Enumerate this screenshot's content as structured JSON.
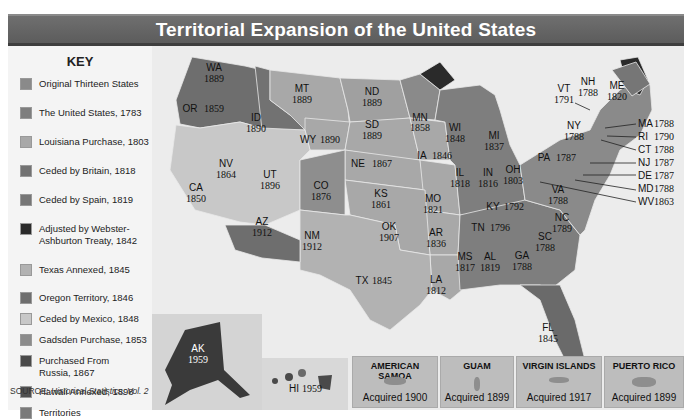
{
  "title": "Territorial Expansion of the United States",
  "key": {
    "heading": "KEY",
    "items": [
      {
        "label": "Original Thirteen States",
        "color": "#8a8a8a"
      },
      {
        "label": "The United States, 1783",
        "color": "#7e7e7e"
      },
      {
        "label": "Louisiana Purchase, 1803",
        "color": "#a8a8a8"
      },
      {
        "label": "Ceded by Britain, 1818",
        "color": "#727272"
      },
      {
        "label": "Ceded by Spain, 1819",
        "color": "#767676"
      },
      {
        "label": "Adjusted by Webster-Ashburton Treaty, 1842",
        "color": "#2a2a2a"
      },
      {
        "label": "Texas Annexed, 1845",
        "color": "#b2b2b2"
      },
      {
        "label": "Oregon Territory, 1846",
        "color": "#6e6e6e"
      },
      {
        "label": "Ceded by Mexico, 1848",
        "color": "#c8c8c8"
      },
      {
        "label": "Gadsden Purchase, 1853",
        "color": "#8c8c8c"
      },
      {
        "label": "Purchased From Russia, 1867",
        "color": "#4a4a4a"
      },
      {
        "label": "Hawaii Annexed, 1898",
        "color": "#505050"
      },
      {
        "label": "Territories",
        "color": "#7a7a7a"
      }
    ],
    "source_prefix": "SOURCE: ",
    "source_title": "Historical Statistics, Vol. 2"
  },
  "states": {
    "WA": {
      "abbr": "WA",
      "year": "1889"
    },
    "OR": {
      "abbr": "OR",
      "year": "1859"
    },
    "ID": {
      "abbr": "ID",
      "year": "1890"
    },
    "MT": {
      "abbr": "MT",
      "year": "1889"
    },
    "WY": {
      "abbr": "WY",
      "year": "1890"
    },
    "ND": {
      "abbr": "ND",
      "year": "1889"
    },
    "SD": {
      "abbr": "SD",
      "year": "1889"
    },
    "MN": {
      "abbr": "MN",
      "year": "1858"
    },
    "WI": {
      "abbr": "WI",
      "year": "1848"
    },
    "MI": {
      "abbr": "MI",
      "year": "1837"
    },
    "NV": {
      "abbr": "NV",
      "year": "1864"
    },
    "UT": {
      "abbr": "UT",
      "year": "1896"
    },
    "CA": {
      "abbr": "CA",
      "year": "1850"
    },
    "CO": {
      "abbr": "CO",
      "year": "1876"
    },
    "NE": {
      "abbr": "NE",
      "year": "1867"
    },
    "IA": {
      "abbr": "IA",
      "year": "1846"
    },
    "KS": {
      "abbr": "KS",
      "year": "1861"
    },
    "MO": {
      "abbr": "MO",
      "year": "1821"
    },
    "IL": {
      "abbr": "IL",
      "year": "1818"
    },
    "IN": {
      "abbr": "IN",
      "year": "1816"
    },
    "OH": {
      "abbr": "OH",
      "year": "1803"
    },
    "AZ": {
      "abbr": "AZ",
      "year": "1912"
    },
    "NM": {
      "abbr": "NM",
      "year": "1912"
    },
    "OK": {
      "abbr": "OK",
      "year": "1907"
    },
    "AR": {
      "abbr": "AR",
      "year": "1836"
    },
    "TX": {
      "abbr": "TX",
      "year": "1845"
    },
    "LA": {
      "abbr": "LA",
      "year": "1812"
    },
    "MS": {
      "abbr": "MS",
      "year": "1817"
    },
    "AL": {
      "abbr": "AL",
      "year": "1819"
    },
    "TN": {
      "abbr": "TN",
      "year": "1796"
    },
    "KY": {
      "abbr": "KY",
      "year": "1792"
    },
    "GA": {
      "abbr": "GA",
      "year": "1788"
    },
    "SC": {
      "abbr": "SC",
      "year": "1788"
    },
    "NC": {
      "abbr": "NC",
      "year": "1789"
    },
    "VA": {
      "abbr": "VA",
      "year": "1788"
    },
    "FL": {
      "abbr": "FL",
      "year": "1845"
    },
    "PA": {
      "abbr": "PA",
      "year": "1787"
    },
    "NY": {
      "abbr": "NY",
      "year": "1788"
    },
    "VT": {
      "abbr": "VT",
      "year": "1791"
    },
    "NH": {
      "abbr": "NH",
      "year": "1788"
    },
    "ME": {
      "abbr": "ME",
      "year": "1820"
    },
    "AK": {
      "abbr": "AK",
      "year": "1959"
    },
    "HI": {
      "abbr": "HI",
      "year": "1959"
    }
  },
  "callouts": [
    {
      "abbr": "MA",
      "year": "1788"
    },
    {
      "abbr": "RI",
      "year": "1790"
    },
    {
      "abbr": "CT",
      "year": "1788"
    },
    {
      "abbr": "NJ",
      "year": "1787"
    },
    {
      "abbr": "DE",
      "year": "1787"
    },
    {
      "abbr": "MD",
      "year": "1788"
    },
    {
      "abbr": "WV",
      "year": "1863"
    }
  ],
  "territories": [
    {
      "name": "AMERICAN SAMOA",
      "acquired": "Acquired 1900"
    },
    {
      "name": "GUAM",
      "acquired": "Acquired 1899"
    },
    {
      "name": "VIRGIN ISLANDS",
      "acquired": "Acquired 1917"
    },
    {
      "name": "PUERTO RICO",
      "acquired": "Acquired 1899"
    }
  ]
}
